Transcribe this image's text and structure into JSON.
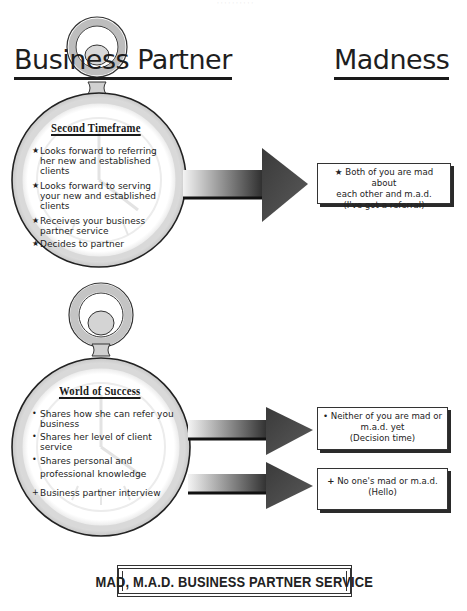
{
  "header": {
    "faint_top_text": "· · · · · · · · · ·"
  },
  "columns": {
    "left_title": "Business Partner",
    "right_title": "Madness"
  },
  "watches": [
    {
      "heading": "Second Timeframe",
      "items": [
        {
          "bullet": "★",
          "text": "Looks forward to referring her new and established clients"
        },
        {
          "bullet": "★",
          "text": "Looks forward to serving your new and established clients"
        },
        {
          "bullet": "★",
          "text": "Receives your business partner service"
        },
        {
          "bullet": "★",
          "text": "Decides to partner"
        }
      ]
    },
    {
      "heading": "World of Success",
      "items": [
        {
          "bullet": "•",
          "text": "Shares how she can refer you business"
        },
        {
          "bullet": "•",
          "text": "Shares her level of client service"
        },
        {
          "bullet": "•",
          "text": "Shares personal and professional knowledge"
        },
        {
          "bullet": "+",
          "text": "Business partner interview"
        }
      ]
    }
  ],
  "outcomes": [
    {
      "bullet": "★",
      "line1": "Both of you are mad about",
      "line2": "each other and m.a.d.",
      "line3": "(I've got a referral)"
    },
    {
      "bullet": "•",
      "line1": "Neither of you are mad or",
      "line2": "m.a.d. yet",
      "line3": "(Decision time)"
    },
    {
      "bullet": "+",
      "line1": "No one's mad or m.a.d.",
      "line2": "(Hello)",
      "line3": ""
    }
  ],
  "footer": {
    "banner_text": "MAD, M.A.D. BUSINESS PARTNER SERVICE"
  },
  "colors": {
    "ink": "#1e1e1e",
    "watch_silver": "#d0d0d0",
    "arrow_dark": "#2a2a2a",
    "arrow_light": "#f2f2f2"
  }
}
